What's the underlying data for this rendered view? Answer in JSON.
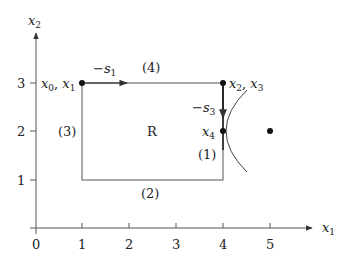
{
  "axes": {
    "x_label": "x",
    "x_label_sub": "1",
    "y_label": "x",
    "y_label_sub": "2",
    "x_ticks": [
      "0",
      "1",
      "2",
      "3",
      "4",
      "5"
    ],
    "y_ticks": [
      "1",
      "2",
      "3"
    ]
  },
  "region": {
    "label": "R",
    "corners": [
      [
        1,
        1
      ],
      [
        4,
        1
      ],
      [
        4,
        3
      ],
      [
        1,
        3
      ]
    ]
  },
  "edges": {
    "e1": "(1)",
    "e2": "(2)",
    "e3": "(3)",
    "e4": "(4)"
  },
  "points": {
    "p01": {
      "label": "x",
      "sub_a": "0",
      "sep": ", ",
      "label_b": "x",
      "sub_b": "1",
      "coord": [
        1,
        3
      ]
    },
    "p23": {
      "label": "x",
      "sub_a": "2",
      "sep": ", ",
      "label_b": "x",
      "sub_b": "3",
      "coord": [
        4,
        3
      ]
    },
    "p4": {
      "label": "x",
      "sub_a": "4",
      "coord": [
        4,
        2
      ]
    },
    "center": {
      "coord": [
        5,
        2
      ]
    }
  },
  "steps": {
    "s1": {
      "prefix": "−",
      "label": "s",
      "sub": "1"
    },
    "s3": {
      "prefix": "−",
      "label": "s",
      "sub": "3"
    }
  },
  "colors": {
    "line": "#555555",
    "dot": "#111111"
  }
}
